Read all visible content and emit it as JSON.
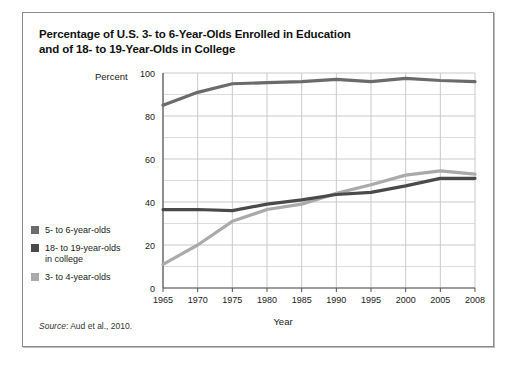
{
  "figure": {
    "title_line1": "Percentage of U.S. 3- to 6-Year-Olds Enrolled in Education",
    "title_line2": "and of 18- to 19-Year-Olds in College",
    "source_word": "Source",
    "source_rest": ": Aud et al., 2010."
  },
  "legend": {
    "position": "left-lower",
    "items": [
      {
        "label": "5- to 6-year-olds",
        "color": "#6b6b6b"
      },
      {
        "label": "18- to 19-year-olds\nin college",
        "color": "#4a4a4a"
      },
      {
        "label": "3- to 4-year-olds",
        "color": "#aaaaaa"
      }
    ]
  },
  "chart_data": {
    "type": "line",
    "title": "Percentage of U.S. 3- to 6-Year-Olds Enrolled in Education and of 18- to 19-Year-Olds in College",
    "xlabel": "Year",
    "ylabel": "Percent",
    "xlim": [
      1965,
      2008
    ],
    "ylim": [
      0,
      100
    ],
    "grid": true,
    "x": [
      1965,
      1970,
      1975,
      1980,
      1985,
      1990,
      1995,
      2000,
      2005,
      2008
    ],
    "xtick_labels": [
      "1965",
      "1970",
      "1975",
      "1980",
      "1985",
      "1990",
      "1995",
      "2000",
      "2005",
      "2008"
    ],
    "ytick_labels": [
      "0",
      "20",
      "40",
      "60",
      "80",
      "100"
    ],
    "yticks": [
      0,
      20,
      40,
      60,
      80,
      100
    ],
    "series": [
      {
        "name": "5- to 6-year-olds",
        "color": "#6b6b6b",
        "values": [
          85,
          91,
          95,
          95.5,
          96,
          97,
          96,
          97.5,
          96.5,
          96
        ]
      },
      {
        "name": "18- to 19-year-olds in college",
        "color": "#4a4a4a",
        "values": [
          36.5,
          36.5,
          36,
          39,
          41,
          43.5,
          44.5,
          47.5,
          51,
          51
        ]
      },
      {
        "name": "3- to 4-year-olds",
        "color": "#aaaaaa",
        "values": [
          11,
          20,
          31,
          36.5,
          39,
          44,
          48,
          52.5,
          54.5,
          53
        ]
      }
    ]
  }
}
